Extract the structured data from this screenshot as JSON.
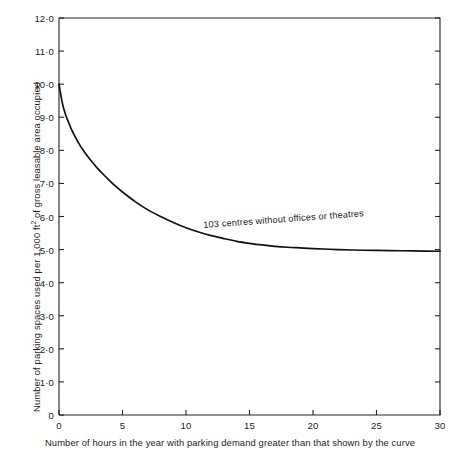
{
  "chart_data": {
    "type": "line",
    "title": "",
    "xlabel": "Number of hours in the year with parking demand greater than that shown by the curve",
    "ylabel": "Number of parking spaces used per 1,000 ft² of gross leasable area occupied",
    "ylabel_parts": {
      "before": "Number of parking spaces used per 1,000 ft",
      "sup": "2",
      "after": " of gross leasable area occupied"
    },
    "xlim": [
      0,
      30
    ],
    "ylim": [
      0,
      12
    ],
    "grid": false,
    "legend": "none",
    "x_ticks": [
      0,
      5,
      10,
      15,
      20,
      25,
      30
    ],
    "x_tick_labels": [
      "0",
      "5",
      "10",
      "15",
      "20",
      "25",
      "30"
    ],
    "y_ticks": [
      0,
      1,
      2,
      3,
      4,
      5,
      6,
      7,
      8,
      9,
      10,
      11,
      12
    ],
    "y_tick_labels": [
      "0",
      "1·0",
      "2·0",
      "3·0",
      "4·0",
      "5·0",
      "6·0",
      "7·0",
      "8·0",
      "9·0",
      "10·0",
      "11·0",
      "12·0"
    ],
    "annotations": [
      {
        "text": "103 centres without offices or theatres",
        "x": 11.3,
        "y": 5.55
      }
    ],
    "series": [
      {
        "name": "103 centres without offices or theatres",
        "color": "#111111",
        "x": [
          0,
          0.25,
          0.5,
          0.75,
          1,
          1.5,
          2,
          2.5,
          3,
          3.5,
          4,
          4.5,
          5,
          6,
          7,
          8,
          9,
          10,
          11,
          12,
          13,
          14,
          15,
          16,
          17,
          18,
          19,
          20,
          22,
          24,
          26,
          28,
          30
        ],
        "y": [
          10.0,
          9.45,
          9.1,
          8.85,
          8.62,
          8.25,
          7.95,
          7.7,
          7.47,
          7.27,
          7.08,
          6.9,
          6.74,
          6.45,
          6.2,
          6.0,
          5.82,
          5.66,
          5.53,
          5.42,
          5.33,
          5.25,
          5.19,
          5.14,
          5.1,
          5.07,
          5.05,
          5.03,
          5.0,
          4.98,
          4.97,
          4.96,
          4.95
        ]
      }
    ]
  },
  "axes": {
    "plot_left_px": 59,
    "plot_right_px": 440,
    "plot_top_px": 18,
    "plot_bottom_px": 415,
    "axis_color": "#222222",
    "curve_color": "#111111",
    "background": "#ffffff"
  }
}
